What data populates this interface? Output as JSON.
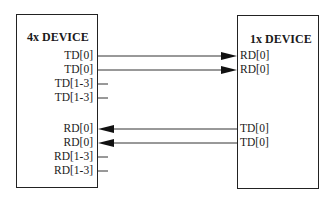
{
  "left_device": {
    "title": "4x DEVICE",
    "pins": [
      {
        "label": "TD[0]",
        "y": 56
      },
      {
        "label": "TD[0]",
        "y": 70
      },
      {
        "label": "TD[1-3]",
        "y": 84
      },
      {
        "label": "TD[1-3]",
        "y": 98
      },
      {
        "label": "RD[0]",
        "y": 129
      },
      {
        "label": "RD[0]",
        "y": 143
      },
      {
        "label": "RD[1-3]",
        "y": 157
      },
      {
        "label": "RD[1-3]",
        "y": 171
      }
    ]
  },
  "right_device": {
    "title": "1x DEVICE",
    "pins": [
      {
        "label": "RD[0]",
        "y": 56
      },
      {
        "label": "RD[0]",
        "y": 70
      },
      {
        "label": "TD[0]",
        "y": 129
      },
      {
        "label": "TD[0]",
        "y": 143
      }
    ]
  },
  "connections": [
    {
      "from": "4x TD[0]",
      "to": "1x RD[0]",
      "direction": "right"
    },
    {
      "from": "4x TD[0]",
      "to": "1x RD[0]",
      "direction": "right"
    },
    {
      "from": "1x TD[0]",
      "to": "4x RD[0]",
      "direction": "left"
    },
    {
      "from": "1x TD[0]",
      "to": "4x RD[0]",
      "direction": "left"
    }
  ],
  "colors": {
    "line": "#222222",
    "background": "#ffffff"
  }
}
